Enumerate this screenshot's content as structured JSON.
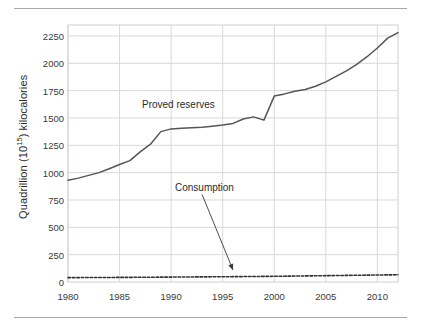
{
  "figure": {
    "top_rule": "",
    "bottom_rule": ""
  },
  "chart_data": {
    "type": "line",
    "title": "",
    "xlabel": "",
    "ylabel": "Quadrillion (10¹⁵) kilocalories",
    "ylabel_prefix": "Quadrillion (10",
    "ylabel_exponent": "15",
    "ylabel_suffix": ") kilocalories",
    "xlim": [
      1980,
      2012
    ],
    "ylim": [
      0,
      2350
    ],
    "ytick_values": [
      0,
      250,
      500,
      750,
      1000,
      1250,
      1500,
      1750,
      2000,
      2250
    ],
    "ytick_labels": [
      "0",
      "250",
      "500",
      "750",
      "1000",
      "1250",
      "1500",
      "1750",
      "2000",
      "2250"
    ],
    "xtick_values": [
      1980,
      1985,
      1990,
      1995,
      2000,
      2005,
      2010
    ],
    "xtick_labels": [
      "1980",
      "1985",
      "1990",
      "1995",
      "2000",
      "2005",
      "2010"
    ],
    "grid": true,
    "grid_color": "#d9d9d9",
    "legend": "none",
    "line_color": "#555555",
    "series": [
      {
        "name": "Proved reserves",
        "style": "solid",
        "color": "#555555",
        "x": [
          1980,
          1981,
          1982,
          1983,
          1984,
          1985,
          1986,
          1987,
          1988,
          1989,
          1990,
          1991,
          1992,
          1993,
          1994,
          1995,
          1996,
          1997,
          1998,
          1999,
          2000,
          2001,
          2002,
          2003,
          2004,
          2005,
          2006,
          2007,
          2008,
          2009,
          2010,
          2011,
          2012
        ],
        "values": [
          930,
          950,
          975,
          1000,
          1035,
          1075,
          1110,
          1190,
          1260,
          1375,
          1400,
          1405,
          1410,
          1415,
          1425,
          1435,
          1450,
          1490,
          1510,
          1480,
          1700,
          1720,
          1745,
          1760,
          1790,
          1830,
          1880,
          1930,
          1990,
          2060,
          2140,
          2230,
          2280
        ]
      },
      {
        "name": "Consumption",
        "style": "dashed",
        "color": "#333333",
        "x": [
          1980,
          1985,
          1990,
          1995,
          2000,
          2005,
          2010,
          2012
        ],
        "values": [
          40,
          42,
          45,
          48,
          52,
          58,
          64,
          66
        ]
      }
    ],
    "annotations": [
      {
        "name": "proved-reserves-label",
        "text": "Proved reserves",
        "x": 1989.3,
        "y": 1620
      },
      {
        "name": "consumption-label",
        "text": "Consumption",
        "x": 1991.8,
        "y": 880
      },
      {
        "name": "consumption-arrow",
        "text": "",
        "from_x": 1993.0,
        "from_y": 800,
        "to_x": 1996.0,
        "to_y": 110
      }
    ]
  }
}
